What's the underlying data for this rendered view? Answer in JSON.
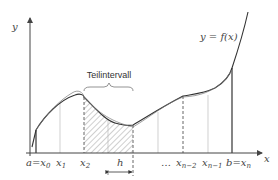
{
  "diagram": {
    "title_label": "Teilintervall",
    "function_label": "y = f(x)",
    "axes": {
      "x_label": "x",
      "y_label": "y"
    },
    "ticks": [
      {
        "main": "a=x",
        "sub": "0"
      },
      {
        "main": "x",
        "sub": "1"
      },
      {
        "main": "x",
        "sub": "2"
      },
      {
        "main": "…",
        "sub": ""
      },
      {
        "main": "x",
        "sub": "n−2"
      },
      {
        "main": "x",
        "sub": "n−1"
      },
      {
        "main": "b=x",
        "sub": "n"
      }
    ],
    "step_label": "h",
    "colors": {
      "curve": "#333333",
      "axis": "#444444",
      "hatch": "#888888",
      "grid": "#bbbbbb"
    }
  }
}
